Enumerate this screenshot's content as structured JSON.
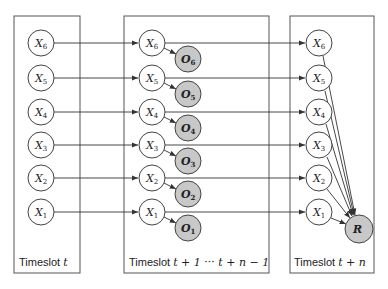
{
  "timeslots": [
    {
      "id": "t",
      "label_text": "Timeslot",
      "label_math": "t"
    },
    {
      "id": "mid",
      "label_text": "Timeslot",
      "label_math": "t + 1 ··· t + n − 1"
    },
    {
      "id": "tn",
      "label_text": "Timeslot",
      "label_math": "t + n"
    }
  ],
  "state_nodes": [
    {
      "base": "X",
      "sub": "6"
    },
    {
      "base": "X",
      "sub": "5"
    },
    {
      "base": "X",
      "sub": "4"
    },
    {
      "base": "X",
      "sub": "3"
    },
    {
      "base": "X",
      "sub": "2"
    },
    {
      "base": "X",
      "sub": "1"
    }
  ],
  "observation_nodes": [
    {
      "base": "O",
      "sub": "6"
    },
    {
      "base": "O",
      "sub": "5"
    },
    {
      "base": "O",
      "sub": "4"
    },
    {
      "base": "O",
      "sub": "3"
    },
    {
      "base": "O",
      "sub": "2"
    },
    {
      "base": "O",
      "sub": "1"
    }
  ],
  "reward_node": {
    "label": "R"
  },
  "colors": {
    "observed_fill": "#c8c8c8",
    "stroke": "#444444"
  }
}
